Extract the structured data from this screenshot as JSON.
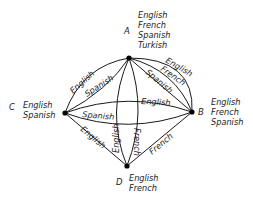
{
  "diagram": {
    "nodes": [
      {
        "id": "A",
        "label": "A",
        "languages": [
          "English",
          "French",
          "Spanish",
          "Turkish"
        ]
      },
      {
        "id": "B",
        "label": "B",
        "languages": [
          "English",
          "French",
          "Spanish"
        ]
      },
      {
        "id": "C",
        "label": "C",
        "languages": [
          "English",
          "Spanish"
        ]
      },
      {
        "id": "D",
        "label": "D",
        "languages": [
          "English",
          "French"
        ]
      }
    ],
    "edges": [
      {
        "from": "A",
        "to": "C",
        "label": "English"
      },
      {
        "from": "A",
        "to": "C",
        "label": "Spanish"
      },
      {
        "from": "A",
        "to": "B",
        "label": "English"
      },
      {
        "from": "A",
        "to": "B",
        "label": "French"
      },
      {
        "from": "A",
        "to": "B",
        "label": "Spanish"
      },
      {
        "from": "C",
        "to": "B",
        "label": "English"
      },
      {
        "from": "C",
        "to": "B",
        "label": "Spanish"
      },
      {
        "from": "A",
        "to": "D",
        "label": "English"
      },
      {
        "from": "A",
        "to": "D",
        "label": "French"
      },
      {
        "from": "C",
        "to": "D",
        "label": "English"
      },
      {
        "from": "B",
        "to": "D",
        "label": "French"
      }
    ]
  }
}
